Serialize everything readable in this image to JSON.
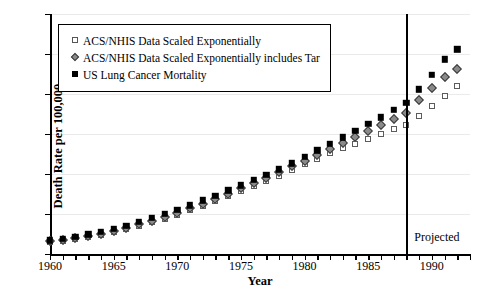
{
  "chart_data": {
    "type": "scatter",
    "title": "",
    "xlabel": "Year",
    "ylabel": "Death Rate per 100,000",
    "xlim": [
      1960,
      1993
    ],
    "ylim": [
      0,
      600
    ],
    "yticks": [
      0,
      100,
      200,
      300,
      400,
      500,
      600
    ],
    "xticks_labeled": [
      1960,
      1965,
      1970,
      1975,
      1980,
      1985,
      1990
    ],
    "xtick_step": 1,
    "grid": true,
    "legend_position": "upper-left",
    "annotations": [
      {
        "text": "Projected",
        "x": 1990.4,
        "y": 40,
        "type": "region-label"
      }
    ],
    "reference_lines": [
      {
        "orientation": "vertical",
        "x": 1988,
        "label": "Projected",
        "color": "#000000"
      }
    ],
    "x": [
      1960,
      1961,
      1962,
      1963,
      1964,
      1965,
      1966,
      1967,
      1968,
      1969,
      1970,
      1971,
      1972,
      1973,
      1974,
      1975,
      1976,
      1977,
      1978,
      1979,
      1980,
      1981,
      1982,
      1983,
      1984,
      1985,
      1986,
      1987,
      1988,
      1989,
      1990,
      1991,
      1992
    ],
    "series": [
      {
        "name": "ACS/NHIS Data Scaled Exponentially",
        "marker": "open-square",
        "color": "#5c5c5c",
        "values": [
          30,
          33,
          37,
          42,
          48,
          55,
          62,
          70,
          79,
          88,
          98,
          109,
          120,
          132,
          145,
          158,
          170,
          182,
          196,
          210,
          224,
          238,
          252,
          264,
          276,
          288,
          300,
          312,
          322,
          345,
          370,
          395,
          420
        ]
      },
      {
        "name": "ACS/NHIS Data Scaled Exponentially includes Tar",
        "marker": "diamond",
        "color": "#8a8a8a",
        "values": [
          32,
          35,
          40,
          45,
          51,
          58,
          66,
          74,
          83,
          93,
          103,
          114,
          126,
          138,
          151,
          164,
          177,
          190,
          204,
          219,
          233,
          248,
          263,
          278,
          293,
          308,
          323,
          338,
          352,
          385,
          415,
          442,
          462
        ]
      },
      {
        "name": "US Lung Cancer Mortality",
        "marker": "filled-square",
        "color": "#000000",
        "values": [
          34,
          38,
          43,
          49,
          56,
          63,
          71,
          80,
          90,
          100,
          111,
          122,
          134,
          146,
          159,
          172,
          185,
          198,
          212,
          227,
          243,
          259,
          275,
          292,
          308,
          325,
          342,
          360,
          378,
          412,
          448,
          487,
          512
        ]
      }
    ]
  },
  "legend": {
    "items": [
      {
        "label": "ACS/NHIS Data Scaled Exponentially",
        "marker": "open-square"
      },
      {
        "label": "ACS/NHIS Data Scaled Exponentially includes Tar",
        "marker": "diamond"
      },
      {
        "label": "US Lung Cancer Mortality",
        "marker": "filled-square"
      }
    ]
  }
}
